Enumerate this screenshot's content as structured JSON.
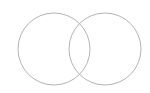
{
  "diagram": {
    "type": "venn",
    "background": "#ffffff",
    "stroke_color": "#b4b4b4",
    "circles": [
      {
        "id": "set-a",
        "cx": 54,
        "cy": 49,
        "r": 36,
        "label": ""
      },
      {
        "id": "set-b",
        "cx": 105,
        "cy": 49,
        "r": 36,
        "label": ""
      }
    ]
  }
}
